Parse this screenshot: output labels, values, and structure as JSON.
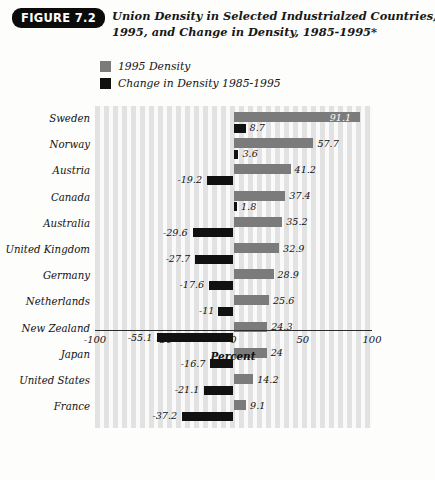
{
  "figure": {
    "badge": "FIGURE 7.2",
    "title_line1": "Union Density in Selected Industrialzed Countries,",
    "title_line2": "1995, and Change in Density, 1985-1995*"
  },
  "legend": {
    "items": [
      {
        "label": "1995 Density",
        "color": "#7b7b7b",
        "swatch": "gray-swatch"
      },
      {
        "label": "Change in Density 1985-1995",
        "color": "#111111",
        "swatch": "black-swatch"
      }
    ]
  },
  "axis": {
    "title": "Percent",
    "ticks": [
      "-100",
      "-50",
      "0",
      "50",
      "100"
    ],
    "tick_values": [
      -100,
      -50,
      0,
      50,
      100
    ],
    "min": -100,
    "max": 100
  },
  "chart_data": {
    "type": "bar",
    "orientation": "horizontal",
    "title": "Union Density in Selected Industrialzed Countries, 1995, and Change in Density, 1985-1995*",
    "xlabel": "Percent",
    "ylabel": "",
    "xlim": [
      -100,
      100
    ],
    "grid": "vertical-stripes",
    "legend_position": "top-left",
    "categories": [
      "Sweden",
      "Norway",
      "Austria",
      "Canada",
      "Australia",
      "United Kingdom",
      "Germany",
      "Netherlands",
      "New Zealand",
      "Japan",
      "United States",
      "France"
    ],
    "series": [
      {
        "name": "1995 Density",
        "color": "#7b7b7b",
        "values": [
          91.1,
          57.7,
          41.2,
          37.4,
          35.2,
          32.9,
          28.9,
          25.6,
          24.3,
          24,
          14.2,
          9.1
        ],
        "labels": [
          "91.1",
          "57.7",
          "41.2",
          "37.4",
          "35.2",
          "32.9",
          "28.9",
          "25.6",
          "24.3",
          "24",
          "14.2",
          "9.1"
        ]
      },
      {
        "name": "Change in Density 1985-1995",
        "color": "#111111",
        "values": [
          8.7,
          3.6,
          -19.2,
          1.8,
          -29.6,
          -27.7,
          -17.6,
          -11,
          -55.1,
          -16.7,
          -21.1,
          -37.2
        ],
        "labels": [
          "8.7",
          "3.6",
          "-19.2",
          "1.8",
          "-29.6",
          "-27.7",
          "-17.6",
          "-11",
          "-55.1",
          "-16.7",
          "-21.1",
          "-37.2"
        ]
      }
    ]
  }
}
